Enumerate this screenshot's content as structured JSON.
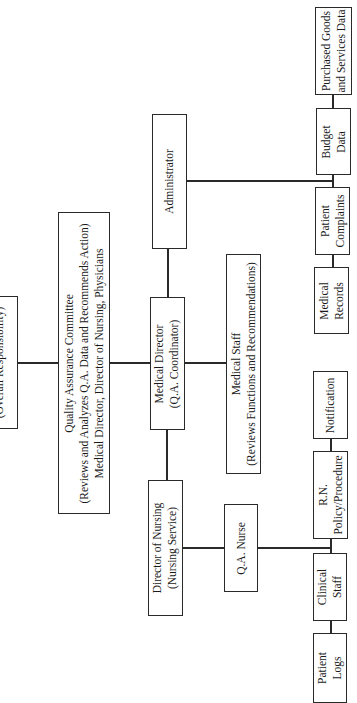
{
  "diagram": {
    "type": "organizational-chart",
    "orientation": "rotated-90-ccw",
    "nodes": {
      "board": {
        "lines": [
          "(Overall Responsibility)"
        ]
      },
      "qa_committee": {
        "lines": [
          "Quality Assurance Committee",
          "(Reviews and Analyzes Q.A. Data and Recommends Action)",
          "Medical Director, Director of Nursing, Physicians"
        ]
      },
      "administrator": {
        "lines": [
          "Administrator"
        ]
      },
      "medical_director": {
        "lines": [
          "Medical Director",
          "(Q.A. Coordinator)"
        ]
      },
      "medical_staff": {
        "lines": [
          "Medical Staff",
          "(Reviews Functions and Recommendations)"
        ]
      },
      "director_nursing": {
        "lines": [
          "Director of Nursing",
          "(Nursing Service)"
        ]
      },
      "qa_nurse": {
        "lines": [
          "Q.A. Nurse"
        ]
      },
      "purchased_goods": {
        "lines": [
          "Purchased Goods",
          "and Services Data"
        ]
      },
      "budget_data": {
        "lines": [
          "Budget",
          "Data"
        ]
      },
      "patient_complaints": {
        "lines": [
          "Patient",
          "Complaints"
        ]
      },
      "medical_records": {
        "lines": [
          "Medical",
          "Records"
        ]
      },
      "notification": {
        "lines": [
          "Notification"
        ]
      },
      "rn_policy": {
        "lines": [
          "R.N.",
          "Policy/Procedure"
        ]
      },
      "clinical_staff": {
        "lines": [
          "Clinical",
          "Staff"
        ]
      },
      "patient_logs": {
        "lines": [
          "Patient",
          "Logs"
        ]
      }
    },
    "edges": [
      [
        "board",
        "qa_committee"
      ],
      [
        "qa_committee",
        "medical_director"
      ],
      [
        "medical_director",
        "administrator"
      ],
      [
        "medical_director",
        "medical_staff"
      ],
      [
        "medical_director",
        "director_nursing"
      ],
      [
        "administrator",
        "purchased_goods"
      ],
      [
        "administrator",
        "budget_data"
      ],
      [
        "administrator",
        "patient_complaints"
      ],
      [
        "administrator",
        "medical_records"
      ],
      [
        "director_nursing",
        "qa_nurse"
      ],
      [
        "qa_nurse",
        "notification"
      ],
      [
        "qa_nurse",
        "rn_policy"
      ],
      [
        "qa_nurse",
        "clinical_staff"
      ],
      [
        "qa_nurse",
        "patient_logs"
      ]
    ]
  }
}
